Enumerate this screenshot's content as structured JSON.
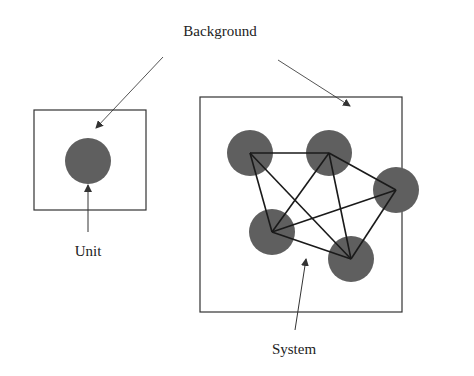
{
  "diagram": {
    "labels": {
      "background": "Background",
      "unit": "Unit",
      "system": "System"
    },
    "colors": {
      "node_fill": "#5f5f5f",
      "edge": "#1a1a1a",
      "box_stroke": "#333333",
      "arrow": "#444444",
      "text": "#222222"
    },
    "unit_panel": {
      "box": {
        "x": 34,
        "y": 110,
        "w": 112,
        "h": 100
      },
      "node": {
        "cx": 88,
        "cy": 161,
        "r": 23
      }
    },
    "system_panel": {
      "box": {
        "x": 200,
        "y": 97,
        "w": 202,
        "h": 215
      },
      "nodes": [
        {
          "id": "A",
          "cx": 250,
          "cy": 153,
          "r": 23
        },
        {
          "id": "B",
          "cx": 329,
          "cy": 153,
          "r": 23
        },
        {
          "id": "C",
          "cx": 396,
          "cy": 190,
          "r": 23
        },
        {
          "id": "D",
          "cx": 272,
          "cy": 232,
          "r": 23
        },
        {
          "id": "E",
          "cx": 351,
          "cy": 259,
          "r": 23
        }
      ],
      "edges": [
        [
          "A",
          "B"
        ],
        [
          "A",
          "D"
        ],
        [
          "A",
          "E"
        ],
        [
          "B",
          "D"
        ],
        [
          "B",
          "E"
        ],
        [
          "B",
          "C"
        ],
        [
          "C",
          "D"
        ],
        [
          "C",
          "E"
        ],
        [
          "D",
          "E"
        ]
      ]
    }
  }
}
